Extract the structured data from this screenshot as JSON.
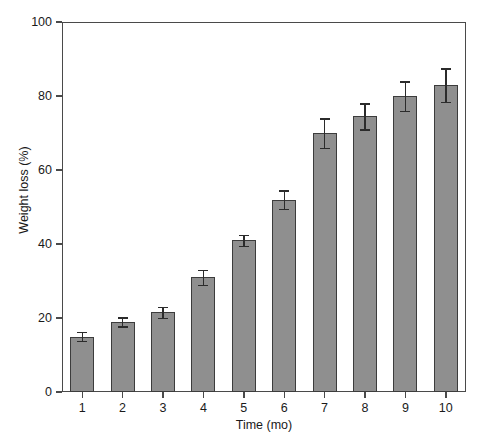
{
  "chart_data": {
    "type": "bar",
    "title": "",
    "xlabel": "Time (mo)",
    "ylabel": "Weight loss (%)",
    "categories": [
      "1",
      "2",
      "3",
      "4",
      "5",
      "6",
      "7",
      "8",
      "9",
      "10"
    ],
    "values": [
      15,
      19,
      21.5,
      31,
      41,
      52,
      70,
      74.5,
      80,
      83
    ],
    "errors": [
      1.2,
      1.2,
      1.5,
      2.0,
      1.5,
      2.5,
      4.0,
      3.5,
      4.0,
      4.5
    ],
    "ylim": [
      0,
      100
    ],
    "yticks": [
      0,
      20,
      40,
      60,
      80,
      100
    ],
    "ytick_labels": [
      "0",
      "20",
      "40",
      "60",
      "80",
      "100"
    ],
    "xticks": [
      1,
      2,
      3,
      4,
      5,
      6,
      7,
      8,
      9,
      10
    ],
    "grid": false,
    "legend": null,
    "bar_color": "#8f8f8f",
    "bar_edge_color": "#3c3c3c",
    "axis_color": "#4a4a4a",
    "error_color": "#2b2b2b",
    "background": "#ffffff",
    "error_bar_style": "symmetric-caps"
  }
}
